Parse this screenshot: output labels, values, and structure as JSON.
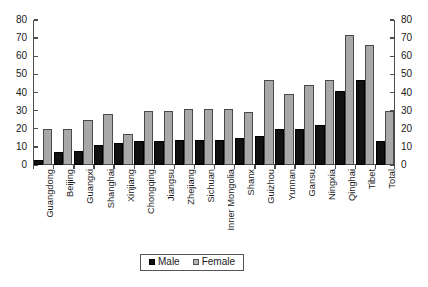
{
  "chart_data": {
    "type": "bar",
    "title": "",
    "subtitle": "",
    "xlabel": "",
    "ylabel": "",
    "ylim": [
      0,
      80
    ],
    "yticks": [
      0,
      10,
      20,
      30,
      40,
      50,
      60,
      70,
      80
    ],
    "ytick_labels": [
      "0",
      "10",
      "20",
      "30",
      "40",
      "50",
      "60",
      "70",
      "80"
    ],
    "grid": false,
    "dual_y_axis": true,
    "legend_position": "bottom-center",
    "legend_entries": [
      "Male",
      "Female"
    ],
    "colors": {
      "male": "#111111",
      "female": "#a8a8a8",
      "axis": "#4d4d4d",
      "text": "#1a1a1a"
    },
    "categories": [
      "Guangdong",
      "Beijing",
      "Guangxi",
      "Shanghai",
      "Xinjiang",
      "Chongqing",
      "Jiangsu",
      "Zhejiang",
      "Sichuan",
      "Inner Mongolia",
      "Shanx",
      "Guizhou",
      "Yunnan",
      "Gansu",
      "Ningxia",
      "Qinghai",
      "Tibet",
      "Total"
    ],
    "series": [
      {
        "name": "Male",
        "color": "#111111",
        "values": [
          3,
          7,
          8,
          11,
          12,
          13,
          13,
          14,
          14,
          14,
          15,
          16,
          20,
          20,
          22,
          41,
          47,
          13
        ]
      },
      {
        "name": "Female",
        "color": "#a8a8a8",
        "values": [
          20,
          20,
          25,
          28,
          17,
          30,
          30,
          31,
          31,
          31,
          29,
          47,
          39,
          44,
          47,
          72,
          66,
          30
        ]
      }
    ]
  }
}
